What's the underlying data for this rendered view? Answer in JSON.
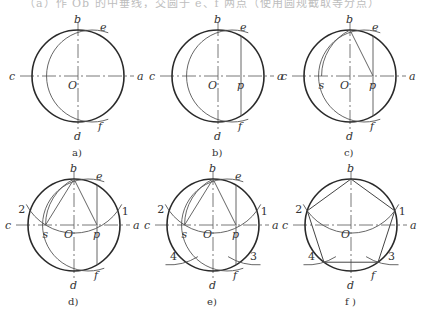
{
  "header": {
    "ghost_text": "（a）作 Ob 的中垂线，交圆于 e、f 两点（使用圆规截取等分点）"
  },
  "radius": 46,
  "panels": [
    {
      "id": "a",
      "caption": "a)",
      "cx": 78,
      "cy": 76,
      "steps": [
        "arc_ef"
      ]
    },
    {
      "id": "b",
      "caption": "b)",
      "cx": 218,
      "cy": 76,
      "steps": [
        "arc_ef",
        "line_ef",
        "p"
      ]
    },
    {
      "id": "c",
      "caption": "c)",
      "cx": 350,
      "cy": 76,
      "steps": [
        "arc_ef",
        "line_ef",
        "p",
        "line_bp",
        "arc_s"
      ]
    },
    {
      "id": "d",
      "caption": "d)",
      "cx": 74,
      "cy": 225,
      "steps": [
        "arc_ef",
        "line_ef",
        "p",
        "line_bp",
        "arc_s",
        "line_bs",
        "arc_12"
      ]
    },
    {
      "id": "e",
      "caption": "e)",
      "cx": 213,
      "cy": 225,
      "steps": [
        "arc_ef",
        "line_ef",
        "p",
        "line_bp",
        "arc_s",
        "line_bs",
        "arc_12",
        "arcs_34"
      ]
    },
    {
      "id": "f",
      "caption": "f )",
      "cx": 351,
      "cy": 225,
      "steps": [
        "arc_12",
        "arcs_34",
        "pentagon"
      ]
    }
  ],
  "labels": {
    "a": "a",
    "b": "b",
    "c": "c",
    "d": "d",
    "e": "e",
    "f": "f",
    "O": "O",
    "p": "p",
    "s": "s",
    "n1": "1",
    "n2": "2",
    "n3": "3",
    "n4": "4"
  },
  "colors": {
    "circle": "#2a2a2a",
    "construction": "#555555",
    "text": "#333333"
  }
}
